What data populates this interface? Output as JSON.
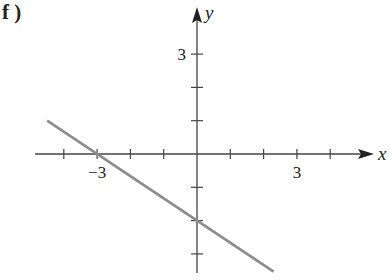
{
  "panel": {
    "label": "f )"
  },
  "chart_data": {
    "type": "line",
    "title": "",
    "xlabel": "x",
    "ylabel": "y",
    "x_tick_labels": [
      {
        "value": -3,
        "text": "−3"
      },
      {
        "value": 3,
        "text": "3"
      }
    ],
    "y_tick_labels": [
      {
        "value": 3,
        "text": "3"
      }
    ],
    "x_ticks": [
      -4,
      -3,
      -2,
      -1,
      1,
      2,
      3,
      4
    ],
    "y_ticks": [
      -3,
      -2,
      -1,
      1,
      2,
      3
    ],
    "xlim": [
      -4.9,
      5.3
    ],
    "ylim": [
      -3.6,
      4.4
    ],
    "grid": false,
    "legend": null,
    "series": [
      {
        "name": "line",
        "equation": "y = -2/3 x - 2",
        "slope": -0.6667,
        "intercept": -2,
        "x_intercept": -3,
        "x": [
          -4.5,
          2.3
        ],
        "y": [
          1.0,
          -3.53
        ],
        "color": "#8c8c8c"
      }
    ]
  },
  "colors": {
    "axis": "#444444",
    "line": "#8c8c8c",
    "background": "#ffffff"
  }
}
